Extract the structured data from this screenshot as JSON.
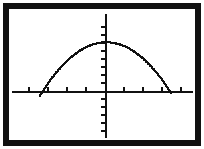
{
  "device": {
    "kind": "graphing-calculator-screen",
    "frame_color": "#111111",
    "screen_background": "#ffffff",
    "ink_color": "#111111",
    "border_width_px": 6,
    "outer_margin_px": 3
  },
  "chart_data": {
    "type": "line",
    "title": "",
    "subtitle": "",
    "xlabel": "",
    "ylabel": "",
    "legend": [],
    "legend_position": "none",
    "grid": false,
    "curve_style": "dotted-pixel",
    "axes": {
      "x_axis_visible": true,
      "y_axis_visible": true,
      "x_axis_pixel_y": 91,
      "y_axis_pixel_x": 105,
      "x_axis_pixel_start": 12,
      "x_axis_pixel_end": 193,
      "y_axis_pixel_start": 14,
      "y_axis_pixel_end": 138,
      "x_tick_spacing_px": 19,
      "y_tick_spacing_px": 8,
      "x_tick_length_px": 4,
      "y_tick_length_px": 4,
      "x_tick_count": 10,
      "y_tick_count": 16,
      "tick_labels_shown": false
    },
    "xlim": [
      -4.9,
      4.6
    ],
    "ylim": [
      -6.1,
      4.8
    ],
    "vertex": {
      "x": 0.0,
      "y": 2.4
    },
    "x_intercepts": [
      -2.5,
      2.5
    ],
    "y_intercept": 2.4,
    "opens": "down",
    "x": [
      -3.5,
      -3.2,
      -2.9,
      -2.6,
      -2.3,
      -2.0,
      -1.7,
      -1.4,
      -1.1,
      -0.8,
      -0.5,
      -0.2,
      0.0,
      0.2,
      0.5,
      0.8,
      1.1,
      1.4,
      1.7,
      2.0,
      2.3,
      2.6,
      2.9,
      3.2,
      3.4
    ],
    "y": [
      -2.3,
      -1.2,
      -0.3,
      0.4,
      1.1,
      1.5,
      1.9,
      2.1,
      2.3,
      2.35,
      2.4,
      2.4,
      2.4,
      2.4,
      2.4,
      2.35,
      2.3,
      2.1,
      1.9,
      1.5,
      1.1,
      0.4,
      -0.3,
      -1.2,
      -2.1
    ],
    "series": [
      {
        "name": "parabola",
        "color": "#111111",
        "values": [
          -2.3,
          -1.2,
          -0.3,
          0.4,
          1.1,
          1.5,
          1.9,
          2.1,
          2.3,
          2.35,
          2.4,
          2.4,
          2.4,
          2.4,
          2.4,
          2.35,
          2.3,
          2.1,
          1.9,
          1.5,
          1.1,
          0.4,
          -0.3,
          -1.2,
          -2.1
        ]
      }
    ]
  }
}
